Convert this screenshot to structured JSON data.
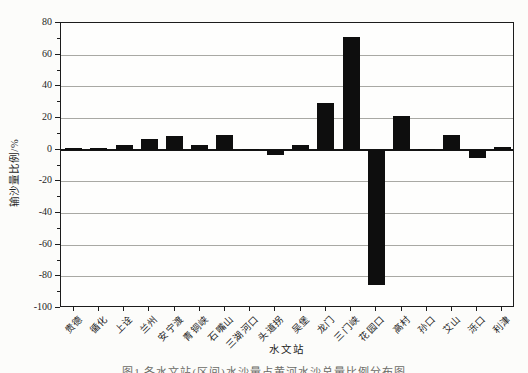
{
  "figure": {
    "y_axis_label": "输沙量比例/%",
    "x_axis_label": "水文站",
    "caption_partial": "图1 各水文站(区间)水沙量占黄河水沙总量比例分布图"
  },
  "chart_data": {
    "type": "bar",
    "title": "",
    "xlabel": "水文站",
    "ylabel": "输沙量比例/%",
    "ylim": [
      -100,
      80
    ],
    "ytick_interval": 20,
    "ytick_minor_interval": 10,
    "grid": "horizontal-gray",
    "legend_position": "none",
    "bar_color": "#0e0e0e",
    "categories": [
      "贵德",
      "循化",
      "上诠",
      "兰州",
      "安宁渡",
      "青铜峡",
      "石嘴山",
      "三湖河口",
      "头道拐",
      "吴堡",
      "龙门",
      "三门峡",
      "花园口",
      "高村",
      "孙口",
      "艾山",
      "泺口",
      "利津"
    ],
    "values": [
      1,
      1,
      3,
      7,
      8.5,
      3,
      9.5,
      0.5,
      -3.5,
      3,
      29.5,
      71,
      -85.5,
      21,
      0.5,
      9.5,
      -5.5,
      2
    ]
  }
}
